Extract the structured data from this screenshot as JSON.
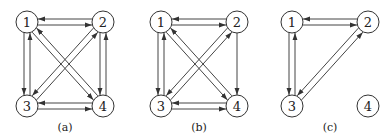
{
  "style": {
    "stroke": "#444444",
    "node_stroke": "#333333",
    "text": "#222222",
    "background": "#ffffff"
  },
  "node_radius": 11,
  "graphs": [
    {
      "id": "a",
      "caption": "(a)",
      "caption_pos": [
        65,
        131
      ],
      "nodes": [
        {
          "id": "1",
          "label": "1",
          "x": 27,
          "y": 22
        },
        {
          "id": "2",
          "label": "2",
          "x": 103,
          "y": 22
        },
        {
          "id": "3",
          "label": "3",
          "x": 27,
          "y": 106
        },
        {
          "id": "4",
          "label": "4",
          "x": 103,
          "y": 106
        }
      ],
      "edges": [
        {
          "from": "1",
          "to": "2"
        },
        {
          "from": "2",
          "to": "1"
        },
        {
          "from": "1",
          "to": "3"
        },
        {
          "from": "3",
          "to": "1"
        },
        {
          "from": "2",
          "to": "4"
        },
        {
          "from": "4",
          "to": "2"
        },
        {
          "from": "3",
          "to": "4"
        },
        {
          "from": "4",
          "to": "3"
        },
        {
          "from": "1",
          "to": "4"
        },
        {
          "from": "4",
          "to": "1"
        },
        {
          "from": "2",
          "to": "3"
        },
        {
          "from": "3",
          "to": "2"
        }
      ]
    },
    {
      "id": "b",
      "caption": "(b)",
      "caption_pos": [
        199,
        131
      ],
      "nodes": [
        {
          "id": "1",
          "label": "1",
          "x": 161,
          "y": 22
        },
        {
          "id": "2",
          "label": "2",
          "x": 237,
          "y": 22
        },
        {
          "id": "3",
          "label": "3",
          "x": 161,
          "y": 106
        },
        {
          "id": "4",
          "label": "4",
          "x": 237,
          "y": 106
        }
      ],
      "edges": [
        {
          "from": "1",
          "to": "2"
        },
        {
          "from": "2",
          "to": "1"
        },
        {
          "from": "1",
          "to": "3"
        },
        {
          "from": "3",
          "to": "1"
        },
        {
          "from": "2",
          "to": "4"
        },
        {
          "from": "3",
          "to": "4"
        },
        {
          "from": "4",
          "to": "3"
        },
        {
          "from": "1",
          "to": "4"
        },
        {
          "from": "4",
          "to": "1"
        },
        {
          "from": "2",
          "to": "3"
        },
        {
          "from": "3",
          "to": "2"
        }
      ]
    },
    {
      "id": "c",
      "caption": "(c)",
      "caption_pos": [
        330,
        131
      ],
      "nodes": [
        {
          "id": "1",
          "label": "1",
          "x": 292,
          "y": 22
        },
        {
          "id": "2",
          "label": "2",
          "x": 368,
          "y": 22
        },
        {
          "id": "3",
          "label": "3",
          "x": 292,
          "y": 106
        },
        {
          "id": "4",
          "label": "4",
          "x": 368,
          "y": 106
        }
      ],
      "edges": [
        {
          "from": "1",
          "to": "2"
        },
        {
          "from": "2",
          "to": "1"
        },
        {
          "from": "1",
          "to": "3"
        },
        {
          "from": "3",
          "to": "1"
        },
        {
          "from": "2",
          "to": "3"
        },
        {
          "from": "3",
          "to": "2"
        }
      ]
    }
  ]
}
